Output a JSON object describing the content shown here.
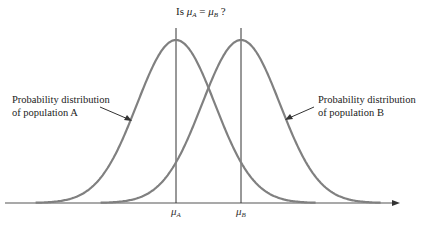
{
  "title": {
    "prefix": "Is ",
    "mu": "μ",
    "sub_a": "A",
    "equals": " = ",
    "sub_b": "B",
    "suffix": " ?"
  },
  "labels": {
    "population_a": {
      "line1": "Probability distribution",
      "line2": "of population A"
    },
    "population_b": {
      "line1": "Probability distribution",
      "line2": "of population B"
    }
  },
  "axis": {
    "tick_a": {
      "mu": "μ",
      "sub": "A"
    },
    "tick_b": {
      "mu": "μ",
      "sub": "B"
    }
  },
  "colors": {
    "curve": "#808080",
    "line": "#333333",
    "text": "#222222"
  },
  "chart_data": {
    "type": "line",
    "title": "Is μA = μB ?",
    "series": [
      {
        "name": "Probability distribution of population A",
        "mean_label": "μA",
        "shape": "normal",
        "mean_px": 176,
        "sigma_px": 39
      },
      {
        "name": "Probability distribution of population B",
        "mean_label": "μB",
        "shape": "normal",
        "mean_px": 241,
        "sigma_px": 39
      }
    ],
    "xlabel": "",
    "ylabel": "",
    "grid": false
  }
}
